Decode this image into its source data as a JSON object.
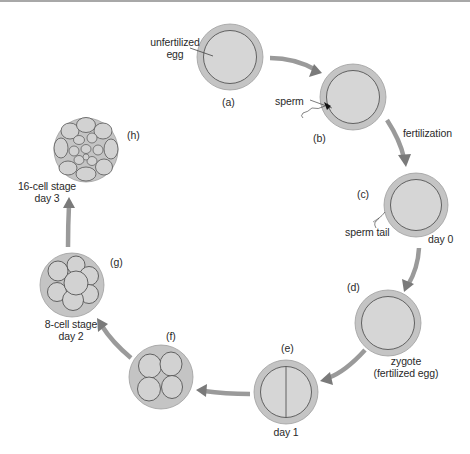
{
  "diagram": {
    "type": "cycle",
    "colors": {
      "membrane": "#c4c4c4",
      "cytoplasm": "#d6d6d6",
      "outline": "#555555",
      "arrow": "#8a8a8a",
      "text": "#2a2a2a"
    },
    "stages": [
      {
        "id": "a",
        "tag": "(a)",
        "label_lines": [
          "unfertilized",
          "egg"
        ],
        "cells": 1
      },
      {
        "id": "b",
        "tag": "(b)",
        "label_lines": [
          "sperm"
        ],
        "cells": 1
      },
      {
        "id": "c",
        "tag": "(c)",
        "label_lines": [
          "sperm tail"
        ],
        "extra": "day 0",
        "cells": 1
      },
      {
        "id": "d",
        "tag": "(d)",
        "label_lines": [
          "zygote",
          "(fertilized egg)"
        ],
        "cells": 1
      },
      {
        "id": "e",
        "tag": "(e)",
        "label_lines": [
          "day 1"
        ],
        "cells": 2
      },
      {
        "id": "f",
        "tag": "(f)",
        "label_lines": [],
        "cells": 4
      },
      {
        "id": "g",
        "tag": "(g)",
        "label_lines": [
          "8-cell stage",
          "day 2"
        ],
        "cells": 8
      },
      {
        "id": "h",
        "tag": "(h)",
        "label_lines": [
          "16-cell stage",
          "day 3"
        ],
        "cells": 16
      }
    ],
    "arrow_labels": {
      "b_to_c": "fertilization"
    }
  }
}
